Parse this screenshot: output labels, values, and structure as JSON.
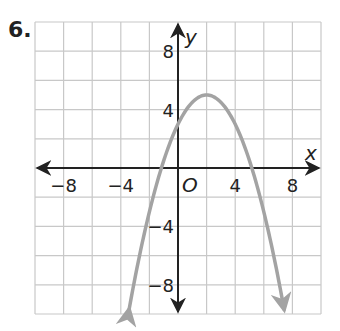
{
  "problem": {
    "number": "6."
  },
  "chart_data": {
    "type": "line",
    "title": "",
    "xlabel": "x",
    "ylabel": "y",
    "xlim": [
      -10,
      10
    ],
    "ylim": [
      -10,
      10
    ],
    "grid": true,
    "grid_step": 2,
    "origin_label": "O",
    "x_ticks": [
      {
        "value": -8,
        "label": "−8"
      },
      {
        "value": -4,
        "label": "−4"
      },
      {
        "value": 4,
        "label": "4"
      },
      {
        "value": 8,
        "label": "8"
      }
    ],
    "y_ticks": [
      {
        "value": 8,
        "label": "8"
      },
      {
        "value": 4,
        "label": "4"
      },
      {
        "value": -4,
        "label": "−4"
      },
      {
        "value": -8,
        "label": "−8"
      }
    ],
    "series": [
      {
        "name": "parabola",
        "equation": "y = -0.5(x - 2)^2 + 5",
        "vertex": [
          2,
          5
        ],
        "y_intercept": 3,
        "x_intercepts": [
          -1.16,
          5.16
        ],
        "x": [
          -3.5,
          -3,
          -2,
          -1,
          0,
          1,
          2,
          3,
          4,
          5,
          6,
          7,
          7.5
        ],
        "values": [
          -10.1,
          -7.5,
          -3,
          0.5,
          3,
          4.5,
          5,
          4.5,
          3,
          0.5,
          -3,
          -7.5,
          -10.1
        ],
        "color": "#a3a3a3",
        "arrows_at_ends": true
      }
    ]
  },
  "colors": {
    "grid": "#c8c8c8",
    "axis": "#222222",
    "curve": "#a3a3a3"
  }
}
